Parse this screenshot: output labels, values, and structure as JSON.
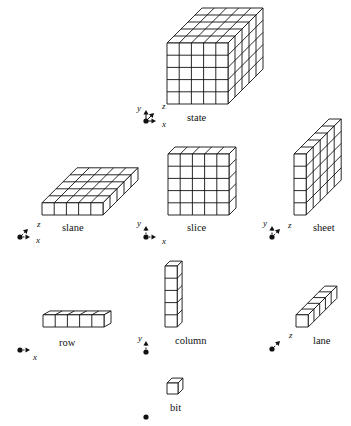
{
  "figure": {
    "parts": [
      {
        "key": "state",
        "label": "state",
        "axes": [
          "y",
          "z",
          "x"
        ]
      },
      {
        "key": "slane",
        "label": "slane",
        "axes": [
          "z",
          "x"
        ]
      },
      {
        "key": "slice",
        "label": "slice",
        "axes": [
          "y",
          "x"
        ]
      },
      {
        "key": "sheet",
        "label": "sheet",
        "axes": [
          "y",
          "z"
        ]
      },
      {
        "key": "row",
        "label": "row",
        "axes": [
          "x"
        ]
      },
      {
        "key": "column",
        "label": "column",
        "axes": [
          "y"
        ]
      },
      {
        "key": "lane",
        "label": "lane",
        "axes": [
          "z"
        ]
      },
      {
        "key": "bit",
        "label": "bit",
        "axes": []
      }
    ],
    "labels": {
      "state": "state",
      "slane": "slane",
      "slice": "slice",
      "sheet": "sheet",
      "row": "row",
      "column": "column",
      "lane": "lane",
      "bit": "bit"
    },
    "axis_letters": {
      "x": "x",
      "y": "y",
      "z": "z"
    },
    "grid": {
      "cells_per_side": 5
    },
    "colors": {
      "line": "#111111",
      "face": "#ffffff"
    }
  }
}
